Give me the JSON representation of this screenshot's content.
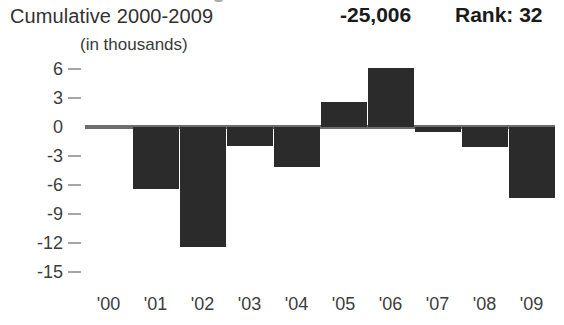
{
  "header": {
    "cumulative_label": "Cumulative 2000-2009",
    "cumulative_value": "-25,006",
    "rank_value": "Rank: 32",
    "units_label": "(in thousands)"
  },
  "colors": {
    "bar": "#2b2b2b",
    "zero_line": "#6d6d6d",
    "tick_mark": "#a6a6a6",
    "text": "#333132",
    "value_text": "#1a1a1a",
    "background": "#ffffff"
  },
  "chart_data": {
    "type": "bar",
    "title": "Cumulative 2000-2009",
    "subtitle": "(in thousands)",
    "xlabel": "",
    "ylabel": "",
    "categories": [
      "'00",
      "'01",
      "'02",
      "'03",
      "'04",
      "'05",
      "'06",
      "'07",
      "'08",
      "'09"
    ],
    "values": [
      0,
      -6.4,
      -12.4,
      -2.0,
      -4.1,
      2.6,
      6.1,
      -0.5,
      -2.1,
      -7.3
    ],
    "series": [
      {
        "name": "Annual net change (thousands)",
        "values": [
          0,
          -6.4,
          -12.4,
          -2.0,
          -4.1,
          2.6,
          6.1,
          -0.5,
          -2.1,
          -7.3
        ]
      }
    ],
    "ylim": [
      -15,
      7.5
    ],
    "yticks": [
      6,
      3,
      0,
      -3,
      -6,
      -9,
      -12,
      -15
    ],
    "ytick_labels": [
      "6",
      "3",
      "0",
      "-3",
      "-6",
      "-9",
      "-12",
      "-15"
    ],
    "grid": false,
    "legend": "none",
    "annotations": {
      "cumulative_total": "-25,006",
      "rank": "Rank: 32"
    }
  }
}
